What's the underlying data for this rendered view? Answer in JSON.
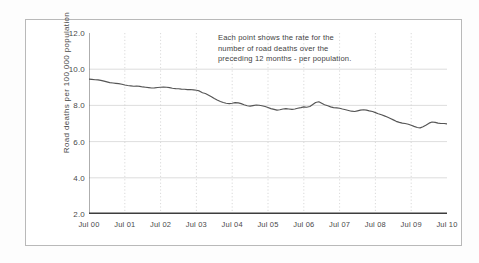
{
  "figure": {
    "annotation": {
      "line1": "Each point shows the rate for the",
      "line2": "number of road deaths over the",
      "line3": "preceding 12 months - per population."
    }
  },
  "chart_data": {
    "type": "line",
    "title": "",
    "xlabel": "",
    "ylabel": "Road deaths per 100 000 population",
    "ylim": [
      2.0,
      12.0
    ],
    "xlim": [
      0,
      10
    ],
    "grid": true,
    "legend_position": "none",
    "y_ticks": [
      "2.0",
      "4.0",
      "6.0",
      "8.0",
      "10.0",
      "12.0"
    ],
    "y_tick_values": [
      2.0,
      4.0,
      6.0,
      8.0,
      10.0,
      12.0
    ],
    "x_ticks": [
      "Jul 00",
      "Jul 01",
      "Jul 02",
      "Jul 03",
      "Jul 04",
      "Jul 05",
      "Jul 06",
      "Jul 07",
      "Jul 08",
      "Jul 09",
      "Jul 10"
    ],
    "x_tick_values": [
      0,
      1,
      2,
      3,
      4,
      5,
      6,
      7,
      8,
      9,
      10
    ],
    "line_color": "#555555",
    "annotations": [
      "Each point shows the rate for the",
      "number of road deaths over the",
      "preceding 12 months - per population."
    ],
    "series": [
      {
        "name": "Road deaths per 100 000 population",
        "x": [
          0.0,
          0.08,
          0.17,
          0.25,
          0.33,
          0.42,
          0.5,
          0.58,
          0.67,
          0.75,
          0.83,
          0.92,
          1.0,
          1.08,
          1.17,
          1.25,
          1.33,
          1.42,
          1.5,
          1.58,
          1.67,
          1.75,
          1.83,
          1.92,
          2.0,
          2.08,
          2.17,
          2.25,
          2.33,
          2.42,
          2.5,
          2.58,
          2.67,
          2.75,
          2.83,
          2.92,
          3.0,
          3.08,
          3.17,
          3.25,
          3.33,
          3.42,
          3.5,
          3.58,
          3.67,
          3.75,
          3.83,
          3.92,
          4.0,
          4.08,
          4.17,
          4.25,
          4.33,
          4.42,
          4.5,
          4.58,
          4.67,
          4.75,
          4.83,
          4.92,
          5.0,
          5.08,
          5.17,
          5.25,
          5.33,
          5.42,
          5.5,
          5.58,
          5.67,
          5.75,
          5.83,
          5.92,
          6.0,
          6.08,
          6.17,
          6.25,
          6.33,
          6.42,
          6.5,
          6.58,
          6.67,
          6.75,
          6.83,
          6.92,
          7.0,
          7.08,
          7.17,
          7.25,
          7.33,
          7.42,
          7.5,
          7.58,
          7.67,
          7.75,
          7.83,
          7.92,
          8.0,
          8.08,
          8.17,
          8.25,
          8.33,
          8.42,
          8.5,
          8.58,
          8.67,
          8.75,
          8.83,
          8.92,
          9.0,
          9.08,
          9.17,
          9.25,
          9.33,
          9.42,
          9.5,
          9.58,
          9.67,
          9.75,
          9.83,
          9.92,
          10.0
        ],
        "values": [
          9.45,
          9.44,
          9.42,
          9.41,
          9.38,
          9.34,
          9.3,
          9.26,
          9.24,
          9.22,
          9.2,
          9.17,
          9.13,
          9.1,
          9.08,
          9.06,
          9.07,
          9.05,
          9.02,
          9.0,
          8.98,
          8.96,
          8.97,
          8.99,
          9.0,
          9.01,
          9.0,
          8.98,
          8.95,
          8.93,
          8.92,
          8.9,
          8.89,
          8.87,
          8.88,
          8.86,
          8.84,
          8.8,
          8.7,
          8.66,
          8.58,
          8.48,
          8.38,
          8.3,
          8.22,
          8.16,
          8.12,
          8.1,
          8.12,
          8.15,
          8.14,
          8.1,
          8.04,
          7.98,
          7.96,
          7.99,
          8.02,
          8.01,
          7.98,
          7.94,
          7.88,
          7.82,
          7.78,
          7.74,
          7.76,
          7.8,
          7.82,
          7.8,
          7.78,
          7.8,
          7.84,
          7.88,
          7.92,
          7.9,
          7.94,
          8.05,
          8.16,
          8.2,
          8.12,
          8.04,
          7.98,
          7.92,
          7.88,
          7.86,
          7.84,
          7.8,
          7.76,
          7.72,
          7.68,
          7.66,
          7.7,
          7.74,
          7.76,
          7.74,
          7.7,
          7.66,
          7.6,
          7.54,
          7.48,
          7.42,
          7.36,
          7.28,
          7.2,
          7.12,
          7.06,
          7.02,
          7.0,
          6.96,
          6.9,
          6.84,
          6.78,
          6.76,
          6.82,
          6.92,
          7.02,
          7.08,
          7.06,
          7.02,
          7.0,
          7.0,
          6.98
        ]
      }
    ]
  }
}
